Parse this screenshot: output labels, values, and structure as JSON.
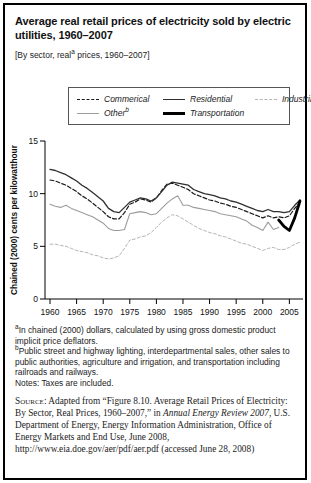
{
  "card": {
    "title": "Average real retail prices of electricity sold by electric utilities, 1960–2007",
    "subtitle": {
      "pre": "[By sector, real",
      "sup": "a",
      "post": " prices, 1960–2007]"
    }
  },
  "legend": {
    "items": [
      {
        "label": "Commerical",
        "sup": "",
        "series_key": "commercial"
      },
      {
        "label": "Residential",
        "sup": "",
        "series_key": "residential"
      },
      {
        "label": "Industrial",
        "sup": "",
        "series_key": "industrial"
      },
      {
        "label": "Other",
        "sup": "b",
        "series_key": "other"
      },
      {
        "label": "Transportation",
        "sup": "",
        "series_key": "transportation"
      }
    ]
  },
  "chart_data": {
    "type": "line",
    "title": "",
    "xlabel": "",
    "ylabel": "Chained (2000) cents per kilowatthour",
    "xlim": [
      1960,
      2007
    ],
    "ylim": [
      0,
      15
    ],
    "x_ticks": [
      1960,
      1965,
      1970,
      1975,
      1980,
      1985,
      1990,
      1995,
      2000,
      2005
    ],
    "y_ticks": [
      0,
      5,
      10,
      15
    ],
    "grid": false,
    "legend_position": "top",
    "series": [
      {
        "name": "Industrial",
        "key": "industrial",
        "color": "#b5b5b5",
        "line_style": "dashed",
        "start_year": 1960,
        "values": [
          5.2,
          5.2,
          5.1,
          5.0,
          4.8,
          4.6,
          4.5,
          4.4,
          4.2,
          4.1,
          3.9,
          3.8,
          3.9,
          4.1,
          4.8,
          5.6,
          5.7,
          5.9,
          6.0,
          6.3,
          6.8,
          7.3,
          7.7,
          8.0,
          7.9,
          7.6,
          7.3,
          7.0,
          6.7,
          6.5,
          6.3,
          6.2,
          6.0,
          5.9,
          5.7,
          5.5,
          5.3,
          5.2,
          5.0,
          4.8,
          4.6,
          4.8,
          4.9,
          4.7,
          4.7,
          4.9,
          5.2,
          5.4
        ]
      },
      {
        "name": "Other",
        "key": "other",
        "color": "#9c9c9c",
        "line_style": "solid",
        "start_year": 1960,
        "values": [
          9.0,
          8.8,
          8.7,
          8.9,
          8.6,
          8.4,
          8.2,
          8.0,
          7.8,
          7.5,
          7.2,
          6.7,
          6.5,
          6.5,
          6.6,
          8.1,
          8.2,
          8.3,
          8.2,
          8.0,
          8.1,
          8.6,
          9.1,
          9.5,
          9.8,
          8.9,
          8.9,
          8.7,
          8.6,
          8.5,
          8.4,
          8.3,
          8.1,
          8.0,
          7.9,
          7.8,
          7.6,
          7.4,
          7.0,
          6.8,
          6.5,
          7.3,
          6.6,
          6.8
        ]
      },
      {
        "name": "Commerical",
        "key": "commercial",
        "color": "#1a1a1a",
        "line_style": "dashed",
        "start_year": 1960,
        "values": [
          11.3,
          11.2,
          11.0,
          10.8,
          10.5,
          10.2,
          9.8,
          9.5,
          9.1,
          8.7,
          8.3,
          7.8,
          7.6,
          7.6,
          8.2,
          9.0,
          9.2,
          9.5,
          9.4,
          9.2,
          9.6,
          10.3,
          10.9,
          11.0,
          10.8,
          10.6,
          10.4,
          10.0,
          9.8,
          9.6,
          9.4,
          9.3,
          9.1,
          9.0,
          8.8,
          8.7,
          8.5,
          8.3,
          8.1,
          7.9,
          7.7,
          7.9,
          7.7,
          7.8,
          7.7,
          7.9,
          8.6,
          9.2
        ]
      },
      {
        "name": "Residential",
        "key": "residential",
        "color": "#2f2f2f",
        "line_style": "solid",
        "start_year": 1960,
        "values": [
          12.3,
          12.2,
          12.0,
          11.8,
          11.5,
          11.2,
          10.8,
          10.5,
          10.1,
          9.7,
          9.3,
          8.6,
          8.3,
          8.2,
          8.7,
          9.2,
          9.4,
          9.6,
          9.5,
          9.3,
          9.6,
          10.2,
          10.8,
          11.1,
          11.0,
          10.9,
          10.8,
          10.4,
          10.2,
          10.0,
          9.9,
          9.8,
          9.6,
          9.5,
          9.3,
          9.2,
          9.0,
          8.8,
          8.6,
          8.4,
          8.3,
          8.5,
          8.3,
          8.3,
          8.2,
          8.3,
          8.9,
          9.4
        ]
      },
      {
        "name": "Transportation",
        "key": "transportation",
        "color": "#000000",
        "line_style": "thick-solid",
        "start_year": 2003,
        "values": [
          7.5,
          6.9,
          6.5,
          7.7,
          9.3
        ]
      }
    ]
  },
  "footnotes": [
    {
      "marker": "a",
      "text": "In chained (2000) dollars, calculated by using gross domestic product implicit price deflators."
    },
    {
      "marker": "b",
      "text": "Public street and highway lighting, interdepartmental sales, other sales to public authorities, agriculture and irrigation, and transportation including railroads and railways."
    }
  ],
  "notes": "Notes: Taxes are included.",
  "source": {
    "label": "Source:",
    "before_italic": "Adapted from “Figure 8.10. Average Retail Prices of Electricity: By Sector, Real Prices, 1960–2007,” in ",
    "italic": "Annual Energy Review 2007",
    "after_italic": ", U.S. Department of Energy, Energy Information Administration, Office of Energy Markets and End Use, June 2008, http://www.eia.doe.gov/aer/pdf/aer.pdf (accessed June 28, 2008)"
  }
}
